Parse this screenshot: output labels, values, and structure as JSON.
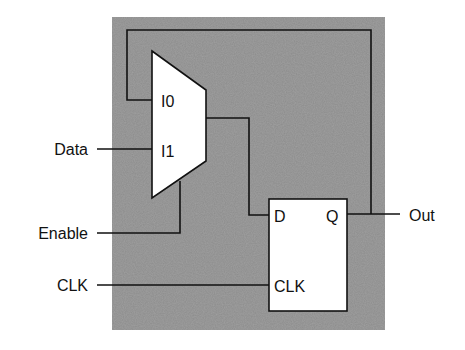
{
  "diagram": {
    "type": "circuit-schematic",
    "background_color": "#8a8a8a",
    "inputs": [
      {
        "label": "Data"
      },
      {
        "label": "Enable"
      },
      {
        "label": "CLK"
      }
    ],
    "output": {
      "label": "Out"
    },
    "mux": {
      "name": "multiplexer",
      "inputs": [
        "I0",
        "I1"
      ]
    },
    "flipflop": {
      "name": "D flip-flop",
      "ports": {
        "d": "D",
        "q": "Q",
        "clk": "CLK"
      }
    }
  }
}
